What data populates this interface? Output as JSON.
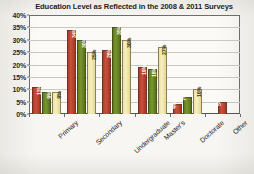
{
  "chart_data": {
    "type": "bar",
    "title": "Education Level as Reflected in the 2008 & 2011 Surveys",
    "xlabel": "",
    "ylabel": "",
    "ylim": [
      0,
      40
    ],
    "ytick_labels": [
      "40%",
      "35%",
      "30%",
      "25%",
      "20%",
      "15%",
      "10%",
      "5%",
      "0%"
    ],
    "ytick_values": [
      40,
      35,
      30,
      25,
      20,
      15,
      10,
      5,
      0
    ],
    "grid": true,
    "legend": "none",
    "categories": [
      "Primary",
      "Secondary",
      "Undergraduate",
      "Master's",
      "Doctorate",
      "Other"
    ],
    "series": [
      {
        "name": "series-1",
        "color": "#c8503c",
        "values": [
          11,
          34,
          26,
          19,
          4,
          5
        ],
        "labels": [
          "11%",
          "34%",
          "26%",
          "19%",
          "4%",
          "5%"
        ]
      },
      {
        "name": "series-2",
        "color": "#78962f",
        "values": [
          9,
          30,
          35,
          18,
          7,
          null
        ],
        "labels": [
          "9%",
          "30%",
          "35%",
          "18%",
          "7%",
          ""
        ]
      },
      {
        "name": "series-3",
        "color": "#f6efc0",
        "values": [
          9,
          25,
          30,
          27,
          10,
          null
        ],
        "labels": [
          "9%",
          "25%",
          "30%",
          "27%",
          "10%",
          ""
        ]
      }
    ]
  }
}
